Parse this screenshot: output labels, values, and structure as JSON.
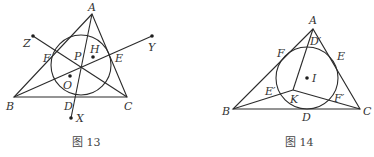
{
  "figures": [
    {
      "id": "fig13",
      "caption": "图 13",
      "labels": {
        "A": "A",
        "B": "B",
        "C": "C",
        "D": "D",
        "E": "E",
        "F": "F",
        "P": "P",
        "H": "H",
        "O": "O",
        "X": "X",
        "Y": "Y",
        "Z": "Z"
      }
    },
    {
      "id": "fig14",
      "caption": "图 14",
      "labels": {
        "A": "A",
        "B": "B",
        "C": "C",
        "D": "D",
        "E": "E",
        "F": "F",
        "D1": "D′",
        "E1": "E′",
        "F1": "F′",
        "I": "I",
        "K": "K"
      }
    }
  ]
}
